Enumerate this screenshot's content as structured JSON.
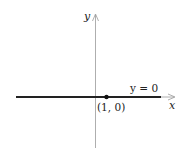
{
  "diagram": {
    "axes": {
      "x_label": "x",
      "y_label": "y",
      "axis_color": "#888888"
    },
    "line": {
      "label": "y = 0",
      "color": "#222222"
    },
    "point": {
      "label": "(1, 0)",
      "x": 1,
      "y": 0,
      "color": "#111111"
    }
  }
}
